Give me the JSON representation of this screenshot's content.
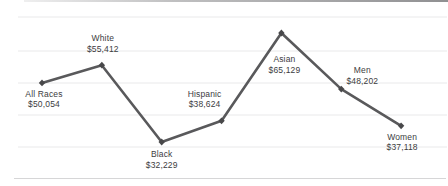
{
  "chart_data": {
    "type": "line",
    "title": "",
    "subtitle": "",
    "xlabel": "",
    "ylabel": "",
    "categories": [
      "All Races",
      "White",
      "Black",
      "Hispanic",
      "Asian",
      "Men",
      "Women"
    ],
    "values": [
      50054,
      55412,
      32229,
      38624,
      65129,
      48202,
      37118
    ],
    "value_labels": [
      "$50,054",
      "$55,412",
      "$32,229",
      "$38,624",
      "$65,129",
      "$48,202",
      "$37,118"
    ],
    "ylim": [
      32229,
      65129
    ],
    "grid": "horizontal-light",
    "legend": "none",
    "axes_visible": false,
    "colors": {
      "line": "#59595b",
      "marker": "#48484a",
      "label_text": "#3c3c3e",
      "gridline": "#e9e9ea",
      "top_border": "#8c8c8e",
      "bottom_border": "#d6d6d7"
    }
  }
}
